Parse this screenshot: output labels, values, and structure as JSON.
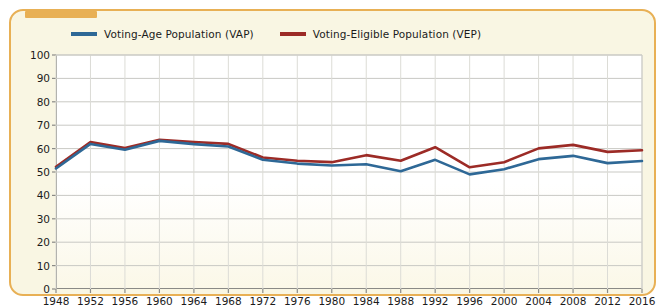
{
  "panel": {
    "border_color": "#e8b055",
    "background_color": "#f9f6e3",
    "tab_color": "#e8b055"
  },
  "chart_data": {
    "type": "line",
    "title": "",
    "subtitle": "",
    "xlabel": "",
    "ylabel": "",
    "grid": true,
    "legend_position": "top",
    "xlim": [
      1948,
      2016
    ],
    "ylim": [
      0,
      100
    ],
    "ytick_labels": [
      "0",
      "10",
      "20",
      "30",
      "40",
      "50",
      "60",
      "70",
      "80",
      "90",
      "100"
    ],
    "yticks": [
      0,
      10,
      20,
      30,
      40,
      50,
      60,
      70,
      80,
      90,
      100
    ],
    "categories": [
      1948,
      1952,
      1956,
      1960,
      1964,
      1968,
      1972,
      1976,
      1980,
      1984,
      1988,
      1992,
      1996,
      2000,
      2004,
      2008,
      2012,
      2016
    ],
    "xtick_labels": [
      "1948",
      "1952",
      "1956",
      "1960",
      "1964",
      "1968",
      "1972",
      "1976",
      "1980",
      "1984",
      "1988",
      "1992",
      "1996",
      "2000",
      "2004",
      "2008",
      "2012",
      "2016"
    ],
    "series": [
      {
        "name": "Voting-Age Population (VAP)",
        "color": "#2e6896",
        "values": [
          51.5,
          62.0,
          59.5,
          63.3,
          61.9,
          60.9,
          55.2,
          53.6,
          52.8,
          53.3,
          50.3,
          55.2,
          49.0,
          51.2,
          55.5,
          56.9,
          53.8,
          54.7
        ]
      },
      {
        "name": "Voting-Eligible Population (VEP)",
        "color": "#9c2b26",
        "values": [
          52.2,
          62.8,
          60.2,
          63.8,
          62.8,
          62.0,
          56.2,
          54.8,
          54.2,
          57.2,
          54.8,
          60.6,
          52.0,
          54.2,
          60.1,
          61.6,
          58.6,
          59.3
        ]
      }
    ]
  }
}
